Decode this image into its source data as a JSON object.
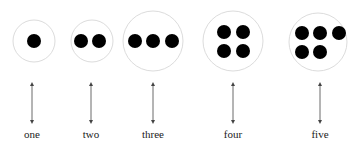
{
  "diagram": {
    "colors": {
      "dot": "#000000",
      "circle_stroke": "#dcdcdc",
      "arrow": "#444444",
      "label": "#222222"
    },
    "groups": [
      {
        "label": "one",
        "count": 1,
        "cx": 34,
        "cy": 41,
        "r": 21,
        "arrow_x": 32,
        "dots": [
          [
            34,
            41
          ]
        ]
      },
      {
        "label": "two",
        "count": 2,
        "cx": 92,
        "cy": 41,
        "r": 21,
        "arrow_x": 91,
        "dots": [
          [
            81,
            41
          ],
          [
            99,
            41
          ]
        ]
      },
      {
        "label": "three",
        "count": 3,
        "cx": 153,
        "cy": 41,
        "r": 30,
        "arrow_x": 153,
        "dots": [
          [
            135,
            41
          ],
          [
            153,
            41
          ],
          [
            172,
            41
          ]
        ]
      },
      {
        "label": "four",
        "count": 4,
        "cx": 233,
        "cy": 41,
        "r": 30,
        "arrow_x": 233,
        "dots": [
          [
            224,
            32
          ],
          [
            243,
            32
          ],
          [
            224,
            51
          ],
          [
            243,
            51
          ]
        ]
      },
      {
        "label": "five",
        "count": 5,
        "cx": 318,
        "cy": 42,
        "r": 29,
        "arrow_x": 320,
        "dots": [
          [
            302,
            33
          ],
          [
            320,
            33
          ],
          [
            339,
            33
          ],
          [
            302,
            52
          ],
          [
            320,
            52
          ]
        ]
      }
    ]
  }
}
